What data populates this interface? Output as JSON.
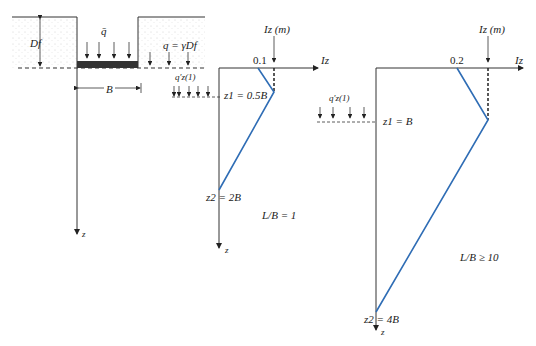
{
  "foundation": {
    "load_label": "q̄",
    "depth_label": "Df",
    "surcharge_label": "q = γDf",
    "width_label": "B",
    "stress_label": "q′z(1)",
    "axis_label": "z"
  },
  "chart_square": {
    "title": "L/B = 1",
    "iz_label": "Iz",
    "izm_label": "Iz (m)",
    "surface_value": "0.1",
    "z1_label": "z1 = 0.5B",
    "z2_label": "z2 = 2B",
    "axis_label": "z"
  },
  "chart_strip": {
    "title": "L/B ≥ 10",
    "iz_label": "Iz",
    "izm_label": "Iz (m)",
    "surface_value": "0.2",
    "z1_label": "z1 = B",
    "z2_label": "z2 = 4B",
    "stress_label": "q′z(1)",
    "axis_label": "z"
  },
  "colors": {
    "profile": "#2f6db5",
    "line": "#333333"
  }
}
